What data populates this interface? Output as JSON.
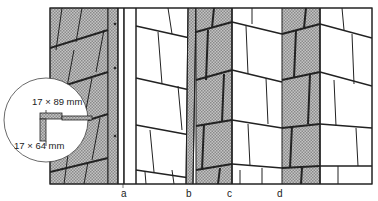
{
  "figure": {
    "inset": {
      "dim_top": "17 × 89 mm",
      "dim_bottom": "17 × 64 mm"
    },
    "labels": [
      "a",
      "b",
      "c",
      "d"
    ],
    "colors": {
      "hatch": "#a8a8a8",
      "line": "#222222",
      "background": "#ffffff"
    }
  }
}
